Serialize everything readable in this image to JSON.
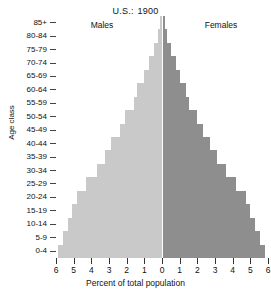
{
  "chart_data": {
    "type": "bar",
    "subtype": "population-pyramid",
    "title_region": "U.S.:",
    "title_year": "1900",
    "xlabel": "Percent of total population",
    "ylabel": "Age class",
    "legend_left": "Males",
    "legend_right": "Females",
    "grid": false,
    "xlim": [
      -6,
      6
    ],
    "xticks": [
      6,
      5,
      4,
      3,
      2,
      1,
      0,
      1,
      2,
      3,
      4,
      5,
      6
    ],
    "xtick_values": [
      -6,
      -5,
      -4,
      -3,
      -2,
      -1,
      0,
      1,
      2,
      3,
      4,
      5,
      6
    ],
    "categories": [
      "0-4",
      "5-9",
      "10-14",
      "15-19",
      "20-24",
      "25-29",
      "30-34",
      "35-39",
      "40-44",
      "45-49",
      "50-54",
      "55-59",
      "60-64",
      "65-69",
      "70-74",
      "75-79",
      "80-84",
      "85+"
    ],
    "categories_top_down": [
      "85+",
      "80-84",
      "75-79",
      "70-74",
      "65-69",
      "60-64",
      "55-59",
      "50-54",
      "45-49",
      "40-44",
      "35-39",
      "30-34",
      "25-29",
      "20-24",
      "15-19",
      "10-14",
      "5-9",
      "0-4"
    ],
    "series": [
      {
        "name": "Males",
        "color": "#c9c9c9",
        "side": "left",
        "values": [
          5.9,
          5.6,
          5.3,
          5.1,
          4.8,
          4.3,
          3.7,
          3.2,
          2.9,
          2.4,
          2.1,
          1.6,
          1.4,
          1.0,
          0.75,
          0.45,
          0.25,
          0.12
        ]
      },
      {
        "name": "Females",
        "color": "#8e8e8e",
        "side": "right",
        "values": [
          5.85,
          5.55,
          5.25,
          5.0,
          4.75,
          4.2,
          3.6,
          3.1,
          2.7,
          2.3,
          2.0,
          1.55,
          1.35,
          1.0,
          0.8,
          0.5,
          0.3,
          0.15
        ]
      }
    ],
    "colors": {
      "males": "#c9c9c9",
      "females": "#8e8e8e",
      "center_line": "#ffffff",
      "axis": "#333333",
      "text": "#111111",
      "background": "#ffffff"
    }
  }
}
